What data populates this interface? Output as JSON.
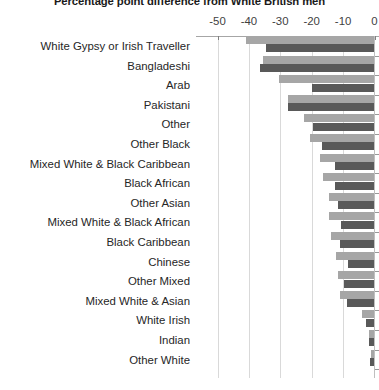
{
  "chart": {
    "title": "Percentage point difference from White British men",
    "axis": {
      "ticks": [
        "-50",
        "-40",
        "-30",
        "-20",
        "-10",
        "0"
      ],
      "values": [
        -50,
        -40,
        -30,
        -20,
        -10,
        0
      ]
    }
  },
  "chart_data": {
    "type": "bar",
    "orientation": "horizontal",
    "title": "Percentage point difference from White British men",
    "xlabel": "",
    "ylabel": "",
    "xlim": [
      -50,
      0
    ],
    "grid": true,
    "legend": "none",
    "colors": {
      "series_a": "#a6a6a6",
      "series_b": "#595959"
    },
    "categories": [
      "White Gypsy or Irish Traveller",
      "Bangladeshi",
      "Arab",
      "Pakistani",
      "Other",
      "Other Black",
      "Mixed White & Black Caribbean",
      "Black African",
      "Other Asian",
      "Mixed White & Black African",
      "Black Caribbean",
      "Chinese",
      "Other Mixed",
      "Mixed White & Asian",
      "White Irish",
      "Indian",
      "Other White"
    ],
    "series": [
      {
        "name": "Series A",
        "color": "#a6a6a6",
        "values": [
          -40.8,
          -35.5,
          -30.5,
          -27.6,
          -22.3,
          -20.4,
          -17.2,
          -16.4,
          -14.6,
          -14.4,
          -13.7,
          -12.3,
          -11.5,
          -11.0,
          -4.0,
          -1.6,
          -1.0
        ]
      },
      {
        "name": "Series B",
        "color": "#595959",
        "values": [
          -34.4,
          -36.5,
          -19.9,
          -27.5,
          -19.7,
          -16.6,
          -12.6,
          -12.6,
          -11.6,
          -10.6,
          -10.9,
          -8.4,
          -9.6,
          -8.6,
          -2.8,
          -1.9,
          -1.3
        ]
      }
    ]
  }
}
